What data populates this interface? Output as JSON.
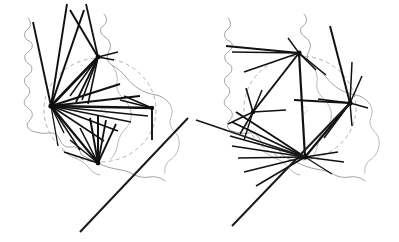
{
  "figure": {
    "panel_count": 2,
    "background_color": "#ffffff",
    "flow_color": "#111111",
    "outline_color": "#8a8a8a",
    "circle_color": "#a8a8a8",
    "width": 399,
    "height": 242
  },
  "panels": [
    {
      "id": "left-panel",
      "name": "left-flow-map",
      "label": "",
      "circle": {
        "cx": 100,
        "cy": 110,
        "rx": 56,
        "ry": 52
      },
      "centroid": {
        "cx": 103,
        "cy": 112
      },
      "hubs": [
        {
          "name": "hub-west",
          "x": 51,
          "y": 106,
          "size": 2.6
        },
        {
          "name": "hub-north",
          "x": 98,
          "y": 57,
          "size": 2.4
        },
        {
          "name": "hub-south",
          "x": 98,
          "y": 163,
          "size": 2.4
        },
        {
          "name": "hub-east",
          "x": 152,
          "y": 108,
          "size": 2.2
        }
      ]
    },
    {
      "id": "right-panel",
      "name": "right-flow-map",
      "label": "",
      "circle": {
        "cx": 300,
        "cy": 108,
        "rx": 56,
        "ry": 52
      },
      "centroid": {
        "cx": 304,
        "cy": 110
      },
      "hubs": [
        {
          "name": "hub-north",
          "x": 299,
          "y": 53,
          "size": 2.6
        },
        {
          "name": "hub-west",
          "x": 253,
          "y": 112,
          "size": 2.2
        },
        {
          "name": "hub-east",
          "x": 350,
          "y": 103,
          "size": 2.6
        },
        {
          "name": "hub-south",
          "x": 305,
          "y": 157,
          "size": 2.6
        }
      ]
    }
  ],
  "chart_data": {
    "type": "flow-map",
    "xlabel": "",
    "ylabel": "",
    "grid": false,
    "legend": "none",
    "panels": [
      "left",
      "right"
    ],
    "left_flows": [
      {
        "hub": "hub-west",
        "x1": 51,
        "y1": 106,
        "x2": 33,
        "y2": 22,
        "w": 1.9
      },
      {
        "hub": "hub-west",
        "x1": 51,
        "y1": 106,
        "x2": 67,
        "y2": 4,
        "w": 1.9
      },
      {
        "hub": "hub-west",
        "x1": 51,
        "y1": 106,
        "x2": 84,
        "y2": 10,
        "w": 2.0
      },
      {
        "hub": "hub-west",
        "x1": 51,
        "y1": 106,
        "x2": 98,
        "y2": 57,
        "w": 2.6
      },
      {
        "hub": "hub-west",
        "x1": 51,
        "y1": 106,
        "x2": 120,
        "y2": 84,
        "w": 2.2
      },
      {
        "hub": "hub-west",
        "x1": 51,
        "y1": 106,
        "x2": 140,
        "y2": 96,
        "w": 1.8
      },
      {
        "hub": "hub-west",
        "x1": 51,
        "y1": 106,
        "x2": 152,
        "y2": 108,
        "w": 2.6
      },
      {
        "hub": "hub-west",
        "x1": 51,
        "y1": 106,
        "x2": 148,
        "y2": 116,
        "w": 1.6
      },
      {
        "hub": "hub-west",
        "x1": 51,
        "y1": 106,
        "x2": 131,
        "y2": 122,
        "w": 1.5
      },
      {
        "hub": "hub-west",
        "x1": 51,
        "y1": 106,
        "x2": 118,
        "y2": 131,
        "w": 1.6
      },
      {
        "hub": "hub-west",
        "x1": 51,
        "y1": 106,
        "x2": 104,
        "y2": 141,
        "w": 1.5
      },
      {
        "hub": "hub-west",
        "x1": 51,
        "y1": 106,
        "x2": 98,
        "y2": 163,
        "w": 2.2
      },
      {
        "hub": "hub-west",
        "x1": 51,
        "y1": 106,
        "x2": 80,
        "y2": 150,
        "w": 1.5
      },
      {
        "hub": "hub-west",
        "x1": 51,
        "y1": 106,
        "x2": 64,
        "y2": 133,
        "w": 1.4
      },
      {
        "hub": "hub-west",
        "x1": 51,
        "y1": 106,
        "x2": 58,
        "y2": 146,
        "w": 1.3
      },
      {
        "hub": "hub-north",
        "x1": 98,
        "y1": 57,
        "x2": 70,
        "y2": 10,
        "w": 2.0
      },
      {
        "hub": "hub-north",
        "x1": 98,
        "y1": 57,
        "x2": 86,
        "y2": 4,
        "w": 1.8
      },
      {
        "hub": "hub-north",
        "x1": 98,
        "y1": 57,
        "x2": 114,
        "y2": 60,
        "w": 1.5
      },
      {
        "hub": "hub-north",
        "x1": 98,
        "y1": 57,
        "x2": 118,
        "y2": 52,
        "w": 1.4
      },
      {
        "hub": "hub-north",
        "x1": 98,
        "y1": 57,
        "x2": 76,
        "y2": 102,
        "w": 1.8
      },
      {
        "hub": "hub-north",
        "x1": 98,
        "y1": 57,
        "x2": 82,
        "y2": 100,
        "w": 1.6
      },
      {
        "hub": "hub-north",
        "x1": 98,
        "y1": 57,
        "x2": 88,
        "y2": 104,
        "w": 1.6
      },
      {
        "hub": "hub-north",
        "x1": 98,
        "y1": 57,
        "x2": 70,
        "y2": 96,
        "w": 1.5
      },
      {
        "hub": "hub-south",
        "x1": 98,
        "y1": 163,
        "x2": 90,
        "y2": 118,
        "w": 2.0
      },
      {
        "hub": "hub-south",
        "x1": 98,
        "y1": 163,
        "x2": 98,
        "y2": 116,
        "w": 2.0
      },
      {
        "hub": "hub-south",
        "x1": 98,
        "y1": 163,
        "x2": 106,
        "y2": 120,
        "w": 1.8
      },
      {
        "hub": "hub-south",
        "x1": 98,
        "y1": 163,
        "x2": 116,
        "y2": 124,
        "w": 1.8
      },
      {
        "hub": "hub-south",
        "x1": 98,
        "y1": 163,
        "x2": 80,
        "y2": 128,
        "w": 1.6
      },
      {
        "hub": "hub-south",
        "x1": 98,
        "y1": 163,
        "x2": 70,
        "y2": 140,
        "w": 1.5
      },
      {
        "hub": "hub-south",
        "x1": 98,
        "y1": 163,
        "x2": 64,
        "y2": 152,
        "w": 1.5
      },
      {
        "hub": "hub-east",
        "x1": 152,
        "y1": 108,
        "x2": 124,
        "y2": 96,
        "w": 1.6
      },
      {
        "hub": "hub-east",
        "x1": 152,
        "y1": 108,
        "x2": 120,
        "y2": 100,
        "w": 1.5
      },
      {
        "hub": "hub-east",
        "x1": 152,
        "y1": 108,
        "x2": 152,
        "y2": 140,
        "w": 1.9
      }
    ],
    "right_flows": [
      {
        "hub": "hub-north",
        "x1": 299,
        "y1": 53,
        "x2": 226,
        "y2": 46,
        "w": 2.0
      },
      {
        "hub": "hub-north",
        "x1": 299,
        "y1": 53,
        "x2": 232,
        "y2": 52,
        "w": 1.7
      },
      {
        "hub": "hub-north",
        "x1": 299,
        "y1": 53,
        "x2": 244,
        "y2": 72,
        "w": 1.6
      },
      {
        "hub": "hub-north",
        "x1": 299,
        "y1": 53,
        "x2": 253,
        "y2": 112,
        "w": 2.0
      },
      {
        "hub": "hub-north",
        "x1": 299,
        "y1": 53,
        "x2": 305,
        "y2": 157,
        "w": 2.2
      },
      {
        "hub": "hub-north",
        "x1": 299,
        "y1": 53,
        "x2": 316,
        "y2": 70,
        "w": 1.6
      },
      {
        "hub": "hub-north",
        "x1": 299,
        "y1": 53,
        "x2": 326,
        "y2": 75,
        "w": 1.5
      },
      {
        "hub": "hub-north",
        "x1": 299,
        "y1": 53,
        "x2": 288,
        "y2": 38,
        "w": 1.4
      },
      {
        "hub": "hub-east",
        "x1": 350,
        "y1": 103,
        "x2": 330,
        "y2": 26,
        "w": 2.0
      },
      {
        "hub": "hub-east",
        "x1": 350,
        "y1": 103,
        "x2": 352,
        "y2": 62,
        "w": 1.5
      },
      {
        "hub": "hub-east",
        "x1": 350,
        "y1": 103,
        "x2": 362,
        "y2": 76,
        "w": 1.5
      },
      {
        "hub": "hub-east",
        "x1": 350,
        "y1": 103,
        "x2": 318,
        "y2": 99,
        "w": 1.6
      },
      {
        "hub": "hub-east",
        "x1": 350,
        "y1": 103,
        "x2": 294,
        "y2": 100,
        "w": 1.9
      },
      {
        "hub": "hub-east",
        "x1": 350,
        "y1": 103,
        "x2": 305,
        "y2": 157,
        "w": 2.2
      },
      {
        "hub": "hub-east",
        "x1": 350,
        "y1": 103,
        "x2": 324,
        "y2": 138,
        "w": 1.6
      },
      {
        "hub": "hub-east",
        "x1": 350,
        "y1": 103,
        "x2": 352,
        "y2": 126,
        "w": 1.5
      },
      {
        "hub": "hub-east",
        "x1": 350,
        "y1": 103,
        "x2": 368,
        "y2": 108,
        "w": 1.4
      },
      {
        "hub": "hub-west",
        "x1": 253,
        "y1": 112,
        "x2": 246,
        "y2": 88,
        "w": 1.6
      },
      {
        "hub": "hub-west",
        "x1": 253,
        "y1": 112,
        "x2": 262,
        "y2": 90,
        "w": 1.5
      },
      {
        "hub": "hub-west",
        "x1": 253,
        "y1": 112,
        "x2": 286,
        "y2": 110,
        "w": 1.6
      },
      {
        "hub": "hub-west",
        "x1": 253,
        "y1": 112,
        "x2": 240,
        "y2": 134,
        "w": 1.5
      },
      {
        "hub": "hub-west",
        "x1": 253,
        "y1": 112,
        "x2": 244,
        "y2": 140,
        "w": 1.4
      },
      {
        "hub": "hub-west",
        "x1": 253,
        "y1": 112,
        "x2": 228,
        "y2": 124,
        "w": 1.4
      },
      {
        "hub": "hub-south",
        "x1": 305,
        "y1": 157,
        "x2": 236,
        "y2": 112,
        "w": 1.9
      },
      {
        "hub": "hub-south",
        "x1": 305,
        "y1": 157,
        "x2": 232,
        "y2": 122,
        "w": 1.7
      },
      {
        "hub": "hub-south",
        "x1": 305,
        "y1": 157,
        "x2": 230,
        "y2": 136,
        "w": 1.8
      },
      {
        "hub": "hub-south",
        "x1": 305,
        "y1": 157,
        "x2": 232,
        "y2": 146,
        "w": 1.7
      },
      {
        "hub": "hub-south",
        "x1": 305,
        "y1": 157,
        "x2": 238,
        "y2": 158,
        "w": 1.6
      },
      {
        "hub": "hub-south",
        "x1": 305,
        "y1": 157,
        "x2": 244,
        "y2": 172,
        "w": 1.6
      },
      {
        "hub": "hub-south",
        "x1": 305,
        "y1": 157,
        "x2": 256,
        "y2": 186,
        "w": 1.5
      },
      {
        "hub": "hub-south",
        "x1": 305,
        "y1": 157,
        "x2": 338,
        "y2": 152,
        "w": 1.5
      },
      {
        "hub": "hub-south",
        "x1": 305,
        "y1": 157,
        "x2": 344,
        "y2": 162,
        "w": 1.4
      },
      {
        "hub": "hub-south",
        "x1": 305,
        "y1": 157,
        "x2": 332,
        "y2": 174,
        "w": 1.3
      }
    ],
    "inter_panel_flows": [
      {
        "name": "long-diagonal-a",
        "x1": 188,
        "y1": 118,
        "x2": 80,
        "y2": 232,
        "w": 2.0
      },
      {
        "name": "long-diagonal-b",
        "x1": 350,
        "y1": 103,
        "x2": 232,
        "y2": 226,
        "w": 2.0
      },
      {
        "name": "long-diagonal-c",
        "x1": 305,
        "y1": 157,
        "x2": 196,
        "y2": 120,
        "w": 1.8
      }
    ]
  }
}
